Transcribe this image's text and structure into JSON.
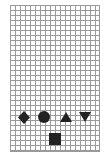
{
  "board": {
    "cols": 18,
    "rows": 29,
    "grid_color": "#9a9a9a",
    "background": "#ffffff"
  },
  "pieces": [
    {
      "shape": "diamond",
      "color": "#222222"
    },
    {
      "shape": "circle",
      "color": "#222222"
    },
    {
      "shape": "triangle-up",
      "color": "#222222"
    },
    {
      "shape": "triangle-down",
      "color": "#222222"
    },
    {
      "shape": "square",
      "color": "#222222"
    }
  ]
}
